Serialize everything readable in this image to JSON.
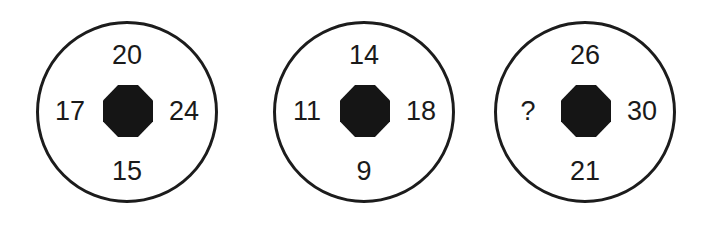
{
  "puzzles": [
    {
      "top": "20",
      "left": "17",
      "right": "24",
      "bottom": "15"
    },
    {
      "top": "14",
      "left": "11",
      "right": "18",
      "bottom": "9"
    },
    {
      "top": "26",
      "left": "?",
      "right": "30",
      "bottom": "21"
    }
  ],
  "colors": {
    "stroke": "#1c1c1c",
    "hub_fill": "#151515",
    "background": "#ffffff"
  }
}
